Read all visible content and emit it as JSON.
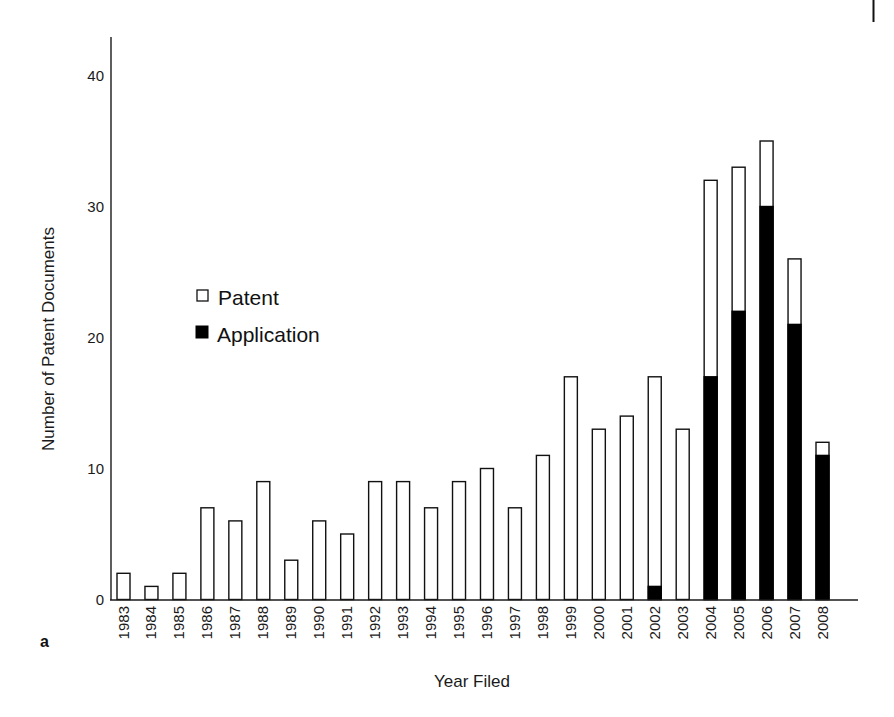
{
  "panel_label": "a",
  "chart_data": {
    "type": "bar",
    "stacked": true,
    "title": "",
    "xlabel": "Year Filed",
    "ylabel": "Number of Patent Documents",
    "ylim": [
      0,
      43
    ],
    "yticks": [
      0,
      10,
      20,
      30,
      40
    ],
    "grid": false,
    "legend_position": "upper-left (inside plot, mid-height)",
    "categories": [
      "1983",
      "1984",
      "1985",
      "1986",
      "1987",
      "1988",
      "1989",
      "1990",
      "1991",
      "1992",
      "1993",
      "1994",
      "1995",
      "1996",
      "1997",
      "1998",
      "1999",
      "2000",
      "2001",
      "2002",
      "2003",
      "2004",
      "2005",
      "2006",
      "2007",
      "2008"
    ],
    "series": [
      {
        "name": "Application",
        "color": "#000000",
        "values": [
          0,
          0,
          0,
          0,
          0,
          0,
          0,
          0,
          0,
          0,
          0,
          0,
          0,
          0,
          0,
          0,
          0,
          0,
          0,
          1,
          0,
          17,
          22,
          30,
          21,
          11
        ]
      },
      {
        "name": "Patent",
        "color": "#ffffff",
        "values": [
          2,
          1,
          2,
          7,
          6,
          9,
          3,
          6,
          5,
          9,
          9,
          7,
          9,
          10,
          7,
          11,
          17,
          13,
          14,
          16,
          13,
          15,
          11,
          5,
          5,
          1
        ]
      }
    ],
    "totals": [
      2,
      1,
      2,
      7,
      6,
      9,
      3,
      6,
      5,
      9,
      9,
      7,
      9,
      10,
      7,
      11,
      17,
      13,
      14,
      17,
      13,
      32,
      33,
      35,
      26,
      12
    ]
  },
  "legend": {
    "items": [
      {
        "label": "Patent",
        "fill": "#ffffff"
      },
      {
        "label": "Application",
        "fill": "#000000"
      }
    ]
  },
  "colors": {
    "axis": "#1a1a1a",
    "bar_stroke": "#111111"
  }
}
